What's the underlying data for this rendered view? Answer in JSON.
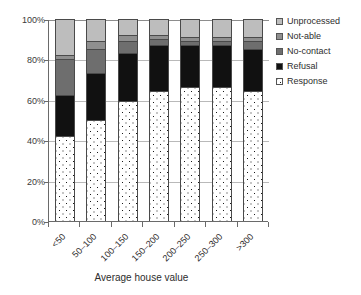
{
  "chart_data": {
    "type": "bar",
    "subtype": "stacked-percent",
    "title": "",
    "xlabel": "Average house value",
    "ylabel": "",
    "categories": [
      "<50",
      "50–100",
      "100–150",
      "150–200",
      "200–250",
      "250–300",
      ">300"
    ],
    "ylim": [
      0,
      100
    ],
    "yticks": [
      0,
      20,
      40,
      60,
      80,
      100
    ],
    "ytick_labels": [
      "0%",
      "20%",
      "40%",
      "60%",
      "80%",
      "100%"
    ],
    "grid": true,
    "legend_position": "right",
    "stack_order_bottom_to_top": [
      "Response",
      "Refusal",
      "No-contact",
      "Not-able",
      "Unprocessed"
    ],
    "series": [
      {
        "name": "Response",
        "color": "#ffffff",
        "pattern": "dotted",
        "values": [
          42,
          50,
          59,
          64,
          66,
          66,
          64
        ]
      },
      {
        "name": "Refusal",
        "color": "#111111",
        "pattern": "solid",
        "values": [
          20,
          23,
          24,
          23,
          21,
          21,
          21
        ]
      },
      {
        "name": "No-contact",
        "color": "#6e6e6e",
        "pattern": "solid",
        "values": [
          18,
          12,
          6,
          3,
          2,
          2,
          4
        ]
      },
      {
        "name": "Not-able",
        "color": "#8f8f8f",
        "pattern": "solid",
        "values": [
          2,
          4,
          3,
          2,
          2,
          2,
          2
        ]
      },
      {
        "name": "Unprocessed",
        "color": "#bdbdbd",
        "pattern": "solid",
        "values": [
          18,
          11,
          8,
          8,
          9,
          9,
          9
        ]
      }
    ],
    "cumulative_tops": [
      [
        42,
        62,
        80,
        82,
        100
      ],
      [
        50,
        73,
        85,
        89,
        100
      ],
      [
        59,
        83,
        89,
        92,
        100
      ],
      [
        64,
        87,
        90,
        92,
        100
      ],
      [
        66,
        87,
        89,
        91,
        100
      ],
      [
        66,
        87,
        89,
        91,
        100
      ],
      [
        64,
        85,
        89,
        91,
        100
      ]
    ]
  },
  "legend": {
    "entries": [
      {
        "label": "Unprocessed",
        "swatch_name": "legend-swatch-unprocessed"
      },
      {
        "label": "Not-able",
        "swatch_name": "legend-swatch-not-able"
      },
      {
        "label": "No-contact",
        "swatch_name": "legend-swatch-no-contact"
      },
      {
        "label": "Refusal",
        "swatch_name": "legend-swatch-refusal"
      },
      {
        "label": "Response",
        "swatch_name": "legend-swatch-response"
      }
    ]
  }
}
